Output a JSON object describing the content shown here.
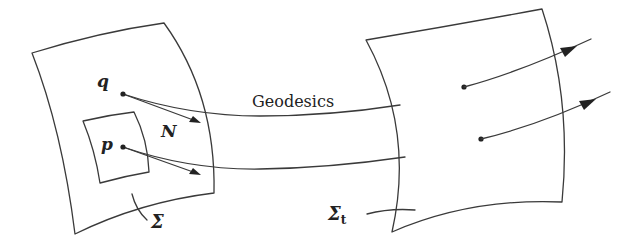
{
  "diagram": {
    "type": "geodesic-flow-illustration",
    "labels": {
      "point_q": "q",
      "point_p": "p",
      "normal": "N",
      "geodesics": "Geodesics",
      "surface_initial": "Σ",
      "surface_evolved": "Σ",
      "surface_evolved_subscript": "t"
    },
    "elements": [
      {
        "name": "initial-surface",
        "label": "Σ"
      },
      {
        "name": "neighborhood-patch",
        "contains": "p"
      },
      {
        "name": "point-q",
        "label": "q"
      },
      {
        "name": "point-p",
        "label": "p"
      },
      {
        "name": "normal-vectors",
        "label": "N",
        "count": 2
      },
      {
        "name": "geodesic-curves",
        "label": "Geodesics",
        "count": 2
      },
      {
        "name": "evolved-surface",
        "label": "Σt"
      },
      {
        "name": "evolved-normal-vectors",
        "count": 2
      }
    ],
    "colors": {
      "stroke": "#3a3a3a",
      "text": "#222222",
      "background": "#ffffff"
    }
  }
}
